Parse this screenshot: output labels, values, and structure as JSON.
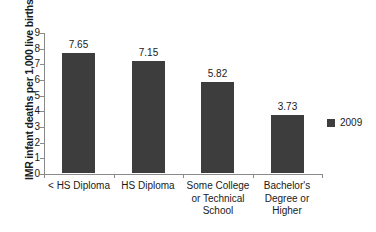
{
  "chart_data": {
    "type": "bar",
    "title": "",
    "xlabel": "",
    "ylabel": "IMR infant deaths per 1,000 live births",
    "categories": [
      "< HS Diploma",
      "HS Diploma",
      "Some College or Technical School",
      "Bachelor's Degree or Higher"
    ],
    "category_lines": [
      [
        "< HS Diploma"
      ],
      [
        "HS Diploma"
      ],
      [
        "Some College",
        "or Technical",
        "School"
      ],
      [
        "Bachelor's",
        "Degree or",
        "Higher"
      ]
    ],
    "series": [
      {
        "name": "2009",
        "values": [
          7.65,
          7.15,
          5.82,
          3.73
        ],
        "labels": [
          "7.65",
          "7.15",
          "5.82",
          "3.73"
        ],
        "color": "#3d3d3d"
      }
    ],
    "ylim": [
      0,
      9
    ],
    "yticks": [
      0,
      1,
      2,
      3,
      4,
      5,
      6,
      7,
      8,
      9
    ],
    "ytick_labels": [
      "0",
      "1",
      "2",
      "3",
      "4",
      "5",
      "6",
      "7",
      "8",
      "9"
    ],
    "grid": false,
    "legend": {
      "position": "right",
      "entries": [
        {
          "label": "2009",
          "color": "#3d3d3d"
        }
      ]
    },
    "axis_color": "#8a8a8a"
  }
}
